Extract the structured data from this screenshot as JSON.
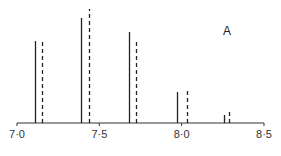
{
  "chart_data": {
    "type": "bar",
    "subtype": "stick-spectrum",
    "title": "",
    "panel_label": "A",
    "xlabel": "",
    "ylabel": "",
    "xlim": [
      7.0,
      8.5
    ],
    "x_ticks": [
      7.0,
      7.5,
      8.0,
      8.5
    ],
    "x_tick_labels": [
      "7·0",
      "7·5",
      "8·0",
      "8·5"
    ],
    "grid": false,
    "legend": null,
    "series": [
      {
        "name": "solid",
        "style": "solid",
        "x": [
          7.11,
          7.39,
          7.68,
          7.97,
          8.26
        ],
        "values": [
          82,
          105,
          91,
          31,
          8
        ]
      },
      {
        "name": "dashed",
        "style": "dashed",
        "x": [
          7.15,
          7.44,
          7.72,
          8.03,
          8.29
        ],
        "values": [
          81,
          114,
          81,
          34,
          11
        ]
      }
    ],
    "value_units": "relative intensity (px, baseline = 0)"
  },
  "axis": {
    "tick_labels": [
      "7·0",
      "7·5",
      "8·0",
      "8·5"
    ]
  },
  "colors": {
    "line": "#222222",
    "axis": "#333333",
    "background": "#ffffff"
  }
}
